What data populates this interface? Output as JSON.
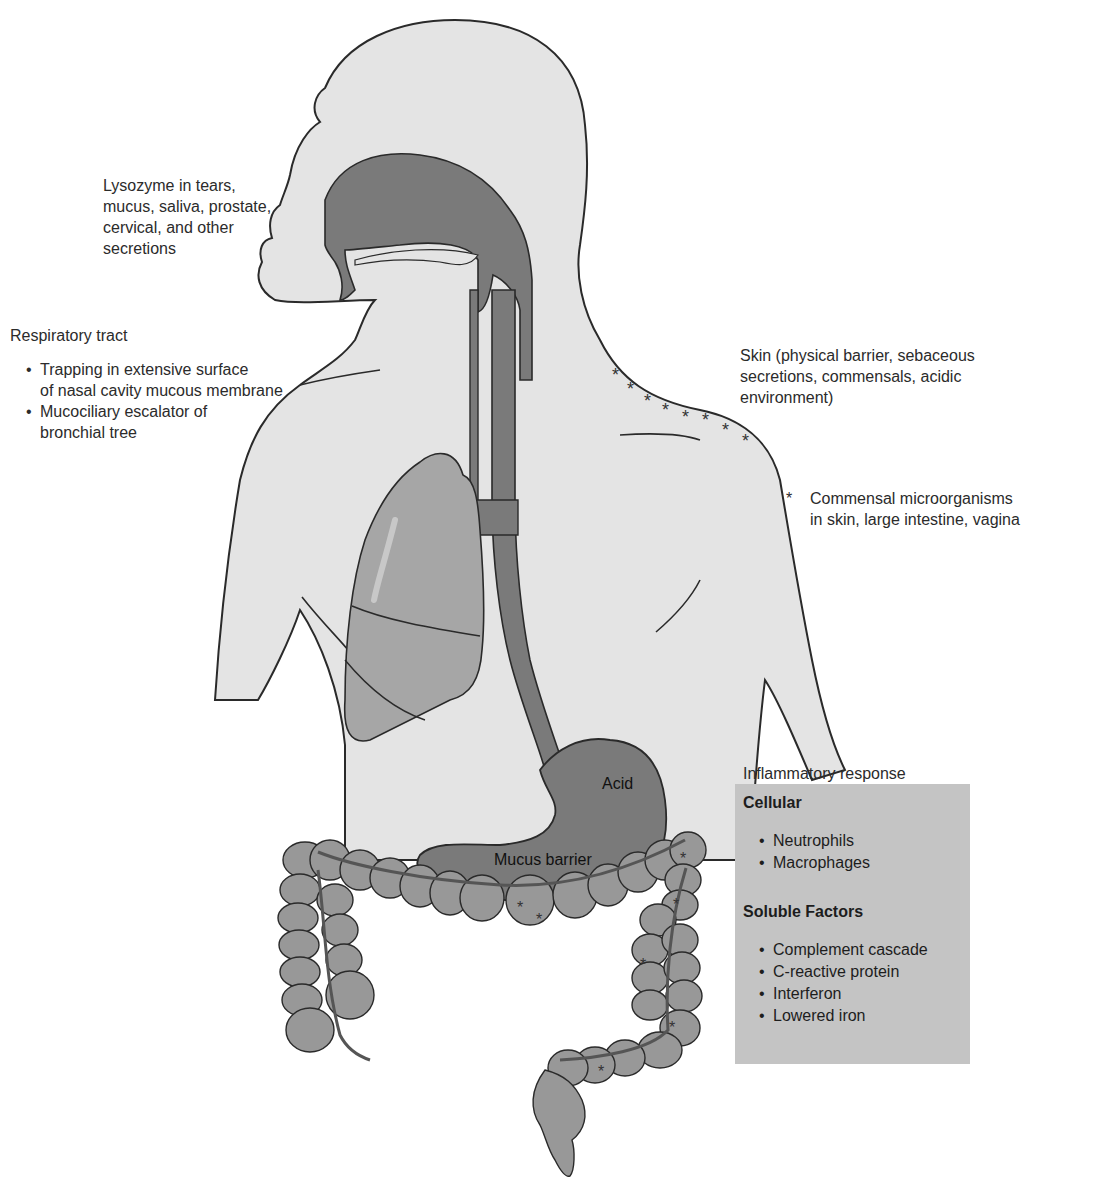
{
  "colors": {
    "background": "#ffffff",
    "body_fill": "#e4e4e4",
    "organ_dark": "#7a7a7a",
    "lung_fill": "#a6a6a6",
    "colon_fill": "#989898",
    "inflammatory_box": "#c4c4c4",
    "outline": "#2a2a2a"
  },
  "labels": {
    "lysozyme": [
      "Lysozyme in tears,",
      "mucus, saliva, prostate,",
      "cervical, and other",
      "secretions"
    ],
    "respiratory": {
      "title": "Respiratory tract",
      "items": [
        [
          "Trapping in extensive surface",
          "of nasal cavity mucous membrane"
        ],
        [
          "Mucociliary escalator of",
          "bronchial tree"
        ]
      ]
    },
    "skin": [
      "Skin (physical barrier, sebaceous",
      "secretions, commensals, acidic",
      "environment)"
    ],
    "commensal": {
      "symbol": "*",
      "lines": [
        "Commensal microorganisms",
        "in skin, large intestine, vagina"
      ]
    },
    "stomach": {
      "acid": "Acid",
      "mucus": "Mucus barrier"
    }
  },
  "inflammatory_response": {
    "title": "Inflammatory response",
    "sections": [
      {
        "heading": "Cellular",
        "items": [
          "Neutrophils",
          "Macrophages"
        ]
      },
      {
        "heading": "Soluble Factors",
        "items": [
          "Complement cascade",
          "C-reactive protein",
          "Interferon",
          "Lowered iron"
        ]
      }
    ]
  },
  "skin_star_symbol": "*"
}
